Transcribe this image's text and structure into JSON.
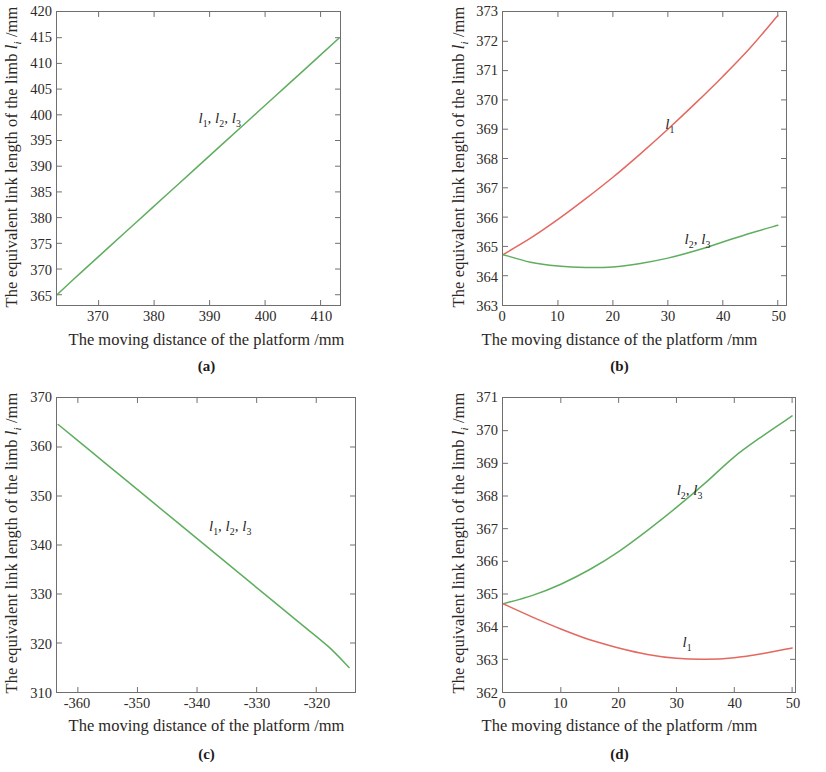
{
  "figure": {
    "ylabel_prefix": "The equivalent link length of the limb ",
    "ylabel_symbol": "l",
    "ylabel_sub": "i",
    "ylabel_suffix": " /mm",
    "xlabel": "The moving distance of the platform /mm",
    "colors": {
      "green": "#5fae5f",
      "red": "#e3685f",
      "axis": "#6f6f6f",
      "text": "#2b2725"
    }
  },
  "panels": [
    {
      "key": "a",
      "caption": "(a)"
    },
    {
      "key": "b",
      "caption": "(b)"
    },
    {
      "key": "c",
      "caption": "(c)"
    },
    {
      "key": "d",
      "caption": "(d)"
    }
  ],
  "chart_data": [
    {
      "panel": "a",
      "type": "line",
      "title": "(a)",
      "xlabel": "The moving distance of the platform /mm",
      "ylabel": "The equivalent link length of the limb li /mm",
      "xlim": [
        362.5,
        413.5
      ],
      "ylim": [
        363.0,
        420.0
      ],
      "xticks": [
        370,
        380,
        390,
        400,
        410
      ],
      "yticks": [
        365,
        370,
        375,
        380,
        385,
        390,
        395,
        400,
        405,
        410,
        415,
        420
      ],
      "grid": false,
      "annotations": [
        {
          "text": "l1, l2, l3",
          "x": 388.0,
          "y": 399.0
        }
      ],
      "series": [
        {
          "name": "l1, l2, l3",
          "color": "#5fae5f",
          "x": [
            362.5,
            367.0,
            372.0,
            377.0,
            382.0,
            387.0,
            392.0,
            397.0,
            402.0,
            407.0,
            413.3
          ],
          "y": [
            365.0,
            369.5,
            374.4,
            379.3,
            384.2,
            389.1,
            394.0,
            398.9,
            403.8,
            408.7,
            414.9
          ]
        }
      ]
    },
    {
      "panel": "b",
      "type": "line",
      "title": "(b)",
      "xlabel": "The moving distance of the platform /mm",
      "ylabel": "The equivalent link length of the limb li /mm",
      "xlim": [
        0,
        51.5
      ],
      "ylim": [
        363,
        373
      ],
      "xticks": [
        0,
        10,
        20,
        30,
        40,
        50
      ],
      "yticks": [
        363,
        364,
        365,
        366,
        367,
        368,
        369,
        370,
        371,
        372,
        373
      ],
      "grid": false,
      "annotations": [
        {
          "text": "l1",
          "x": 29.5,
          "y": 369.1
        },
        {
          "text": "l2, l3",
          "x": 33.0,
          "y": 365.2
        }
      ],
      "series": [
        {
          "name": "l1",
          "color": "#e3685f",
          "x": [
            0,
            5,
            10,
            15,
            20,
            25,
            30,
            35,
            40,
            45,
            50
          ],
          "y": [
            364.72,
            365.28,
            365.92,
            366.62,
            367.36,
            368.16,
            369.0,
            369.88,
            370.8,
            371.78,
            372.88
          ]
        },
        {
          "name": "l2, l3",
          "color": "#5fae5f",
          "x": [
            0,
            5,
            10,
            15,
            20,
            25,
            30,
            35,
            40,
            45,
            50
          ],
          "y": [
            364.72,
            364.46,
            364.33,
            364.28,
            364.3,
            364.42,
            364.6,
            364.85,
            365.15,
            365.45,
            365.72
          ]
        }
      ]
    },
    {
      "panel": "c",
      "type": "line",
      "title": "(c)",
      "xlabel": "The moving distance of the platform /mm",
      "ylabel": "The equivalent link length of the limb li /mm",
      "xlim": [
        -363.5,
        -313.5
      ],
      "ylim": [
        310,
        370
      ],
      "xticks": [
        -360,
        -350,
        -340,
        -330,
        -320
      ],
      "yticks": [
        310,
        320,
        330,
        340,
        350,
        360,
        370
      ],
      "grid": false,
      "annotations": [
        {
          "text": "l1, l2, l3",
          "x": -338.0,
          "y": 343.5
        }
      ],
      "series": [
        {
          "name": "l1, l2, l3",
          "color": "#5fae5f",
          "x": [
            -363.3,
            -358,
            -353,
            -348,
            -343,
            -338,
            -333,
            -328,
            -323,
            -318,
            -314.5
          ],
          "y": [
            364.6,
            359.3,
            354.3,
            349.3,
            344.3,
            339.3,
            334.3,
            329.3,
            324.3,
            319.3,
            315.0
          ]
        }
      ]
    },
    {
      "panel": "d",
      "type": "line",
      "title": "(d)",
      "xlabel": "The moving distance of the platform /mm",
      "ylabel": "The equivalent link length of the limb li /mm",
      "xlim": [
        0,
        50.5
      ],
      "ylim": [
        362,
        371
      ],
      "xticks": [
        0,
        10,
        20,
        30,
        40,
        50
      ],
      "yticks": [
        362,
        363,
        364,
        365,
        366,
        367,
        368,
        369,
        370,
        371
      ],
      "grid": false,
      "annotations": [
        {
          "text": "l2, l3",
          "x": 30.0,
          "y": 368.1
        },
        {
          "text": "l1",
          "x": 31.0,
          "y": 363.5
        }
      ],
      "series": [
        {
          "name": "l2, l3",
          "color": "#5fae5f",
          "x": [
            0,
            5,
            10,
            15,
            20,
            25,
            30,
            35,
            40,
            45,
            50
          ],
          "y": [
            364.7,
            364.95,
            365.3,
            365.75,
            366.3,
            366.95,
            367.65,
            368.4,
            369.2,
            369.85,
            370.45
          ]
        },
        {
          "name": "l1",
          "color": "#e3685f",
          "x": [
            0,
            5,
            10,
            15,
            20,
            25,
            30,
            35,
            40,
            45,
            50
          ],
          "y": [
            364.7,
            364.3,
            363.93,
            363.6,
            363.35,
            363.15,
            363.03,
            363.0,
            363.05,
            363.18,
            363.35
          ]
        }
      ]
    }
  ]
}
